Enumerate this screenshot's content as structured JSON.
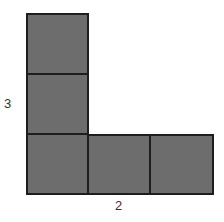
{
  "diagram": {
    "shape": "L-shape made of 5 unit squares",
    "fill_color": "#6d6d6d",
    "border_color": "#1e1e1e",
    "labels": {
      "height": "3",
      "width": "2"
    },
    "squares": [
      {
        "col": 0,
        "row": 0
      },
      {
        "col": 0,
        "row": 1
      },
      {
        "col": 0,
        "row": 2
      },
      {
        "col": 1,
        "row": 2
      },
      {
        "col": 2,
        "row": 2
      }
    ]
  }
}
